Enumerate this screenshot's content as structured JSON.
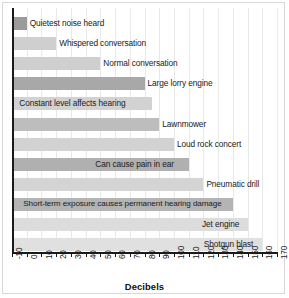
{
  "chart_data": {
    "type": "bar",
    "orientation": "horizontal",
    "title": "",
    "xlabel": "Decibels",
    "ylabel": "",
    "xlim": [
      -10,
      170
    ],
    "grid": true,
    "legend": false,
    "xticks": [
      "-10",
      "0",
      "10",
      "20",
      "30",
      "40",
      "50",
      "60",
      "70",
      "80",
      "90",
      "100",
      "110",
      "120",
      "130",
      "140",
      "150",
      "160",
      "170"
    ],
    "categories": [
      "Quietest noise heard",
      "Whispered conversation",
      "Normal conversation",
      "Large lorry engine",
      "Constant level affects hearing",
      "Lawnmower",
      "Loud rock concert",
      "Can cause pain in ear",
      "Pneumatic drill",
      "Short-term exposure causes permanent hearing damage",
      "Jet engine",
      "Shotgun blast"
    ],
    "values": [
      0,
      20,
      50,
      80,
      85,
      90,
      100,
      110,
      120,
      140,
      150,
      160
    ],
    "bar_colors": [
      "#9b9b9b",
      "#cfcfcf",
      "#cfcfcf",
      "#a8a8a8",
      "#d2d2d2",
      "#bdbdbd",
      "#d2d2d2",
      "#b0b0b0",
      "#d4d4d4",
      "#b4b4b4",
      "#dcdcdc",
      "#e0e0e0"
    ]
  },
  "axis": {
    "xlabel": "Decibels"
  }
}
